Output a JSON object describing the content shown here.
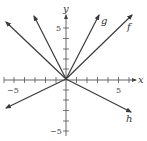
{
  "diagram": {
    "type": "coordinate-plane-lines",
    "origin_px": [
      66,
      79
    ],
    "unit_px": 10.4,
    "axes": {
      "x_label": "x",
      "y_label": "y",
      "x_ticks": [
        -6,
        -5,
        -4,
        -3,
        -2,
        -1,
        1,
        2,
        3,
        4,
        5,
        6
      ],
      "y_ticks": [
        -5,
        -4,
        -3,
        -2,
        -1,
        1,
        2,
        3,
        4,
        5
      ],
      "x_tick_labels": {
        "neg": "−5",
        "pos": "5"
      },
      "y_tick_labels": {
        "neg": "−5",
        "pos": "5"
      }
    },
    "lines": [
      {
        "name": "f",
        "label": "f",
        "slope": 1,
        "end_px": [
          132,
          15
        ]
      },
      {
        "name": "g",
        "label": "g",
        "slope": 2,
        "end_px": [
          99,
          15
        ]
      },
      {
        "name": "h",
        "label": "h",
        "slope": -0.5,
        "end_px": [
          131,
          112
        ]
      },
      {
        "name": "unlabeled-steep-negative",
        "label": "",
        "slope": -2,
        "end_px": [
          34,
          16
        ]
      },
      {
        "name": "unlabeled-negative",
        "label": "",
        "slope": -1,
        "end_px": [
          6,
          22
        ]
      },
      {
        "name": "unlabeled-shallow-positive",
        "label": "",
        "slope": 0.5,
        "end_px": [
          6,
          108
        ]
      }
    ],
    "colors": {
      "line": "#3a3a3a",
      "axis": "#444444",
      "background": "#ffffff"
    }
  }
}
